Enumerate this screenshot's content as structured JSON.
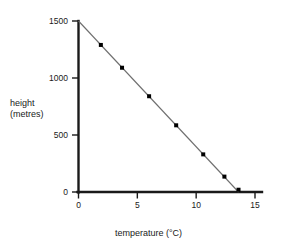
{
  "chart_data": {
    "type": "line",
    "title": "",
    "subtitle": "",
    "xlabel": "temperature (°C)",
    "ylabel": "height\n(metres)",
    "ylabel_line1": "height",
    "ylabel_line2": "(metres)",
    "xlim": [
      0,
      15
    ],
    "ylim": [
      0,
      1500
    ],
    "xticks": [
      0,
      5,
      10,
      15
    ],
    "xtick_labels": [
      "0",
      "5",
      "10",
      "15"
    ],
    "yticks": [
      0,
      500,
      1000,
      1500
    ],
    "ytick_labels": [
      "0",
      "500",
      "1000",
      "1500"
    ],
    "grid": false,
    "legend": null,
    "marker": "square",
    "marker_color": "#000000",
    "line_color": "#6e6e6e",
    "axis_color": "#1a1a1a",
    "line_endpoints": [
      {
        "x": 0,
        "y": 1500
      },
      {
        "x": 13.6,
        "y": 0
      }
    ],
    "series": [
      {
        "name": "height vs temperature",
        "x": [
          0,
          1.9,
          3.7,
          6.0,
          8.3,
          10.6,
          12.4,
          13.6
        ],
        "y": [
          1500,
          1290,
          1090,
          840,
          585,
          330,
          135,
          20
        ],
        "marker_points": [
          {
            "x": 1.9,
            "y": 1290
          },
          {
            "x": 3.7,
            "y": 1090
          },
          {
            "x": 6.0,
            "y": 840
          },
          {
            "x": 8.3,
            "y": 585
          },
          {
            "x": 10.6,
            "y": 330
          },
          {
            "x": 12.4,
            "y": 135
          },
          {
            "x": 13.6,
            "y": 20
          }
        ]
      }
    ],
    "annotations": []
  },
  "axes": {
    "y_title_line1": "height",
    "y_title_line2": "(metres)",
    "x_title": "temperature (°C)",
    "y_tick_1500": "1500",
    "y_tick_1000": "1000",
    "y_tick_500": "500",
    "y_tick_0": "0",
    "x_tick_0": "0",
    "x_tick_5": "5",
    "x_tick_10": "10",
    "x_tick_15": "15"
  }
}
